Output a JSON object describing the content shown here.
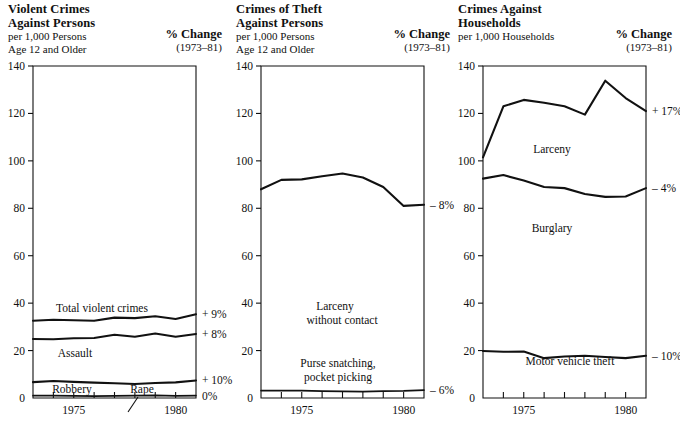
{
  "panels": [
    {
      "title_line1": "Violent Crimes",
      "title_line2": "Against Persons",
      "sub_line1": "per 1,000 Persons",
      "sub_line2": "Age 12 and Older",
      "pct_title": "% Change",
      "pct_years": "(1973–81)",
      "annotations": [
        {
          "text": "Total violent crimes"
        },
        {
          "text": "Assault"
        },
        {
          "text": "Robbery"
        },
        {
          "text": "Rape"
        }
      ],
      "pct_labels": [
        "+ 9%",
        "+ 8%",
        "+ 10%",
        "0%"
      ]
    },
    {
      "title_line1": "Crimes of Theft",
      "title_line2": "Against Persons",
      "sub_line1": "per 1,000 Persons",
      "sub_line2": "Age 12 and Older",
      "pct_title": "% Change",
      "pct_years": "(1973–81)",
      "annotations": [
        {
          "text": "Larceny"
        },
        {
          "text": "without contact"
        },
        {
          "text": "Purse snatching,"
        },
        {
          "text": "pocket picking"
        }
      ],
      "pct_labels": [
        "– 8%",
        "– 6%"
      ]
    },
    {
      "title_line1": "Crimes Against",
      "title_line2": "Households",
      "sub_line1": "per 1,000 Households",
      "sub_line2": "",
      "pct_title": "% Change",
      "pct_years": "(1973–81)",
      "annotations": [
        {
          "text": "Larceny"
        },
        {
          "text": "Burglary"
        },
        {
          "text": "Motor vehicle theft"
        }
      ],
      "pct_labels": [
        "+ 17%",
        "– 4%",
        "– 10%"
      ]
    }
  ],
  "axis": {
    "y_ticks": [
      0,
      20,
      40,
      60,
      80,
      100,
      120,
      140
    ],
    "y_min": 0,
    "y_max": 140,
    "x_min": 1973,
    "x_max": 1981,
    "x_tick_years": [
      1974,
      1975,
      1976,
      1977,
      1978,
      1979,
      1980,
      1981
    ],
    "x_labels": [
      {
        "year": 1975,
        "text": "1975"
      },
      {
        "year": 1980,
        "text": "1980"
      }
    ]
  },
  "colors": {
    "ink": "#111111",
    "background": "#ffffff"
  },
  "chart_data": [
    {
      "type": "line",
      "title": "Violent Crimes Against Persons",
      "subtitle": "per 1,000 Persons Age 12 and Older",
      "xlabel": "",
      "ylabel": "per 1,000 Persons Age 12 and Older",
      "ylim": [
        0,
        140
      ],
      "xlim": [
        1973,
        1981
      ],
      "grid": false,
      "legend": "inline-annotations",
      "x": [
        1973,
        1974,
        1975,
        1976,
        1977,
        1978,
        1979,
        1980,
        1981
      ],
      "series": [
        {
          "name": "Total violent crimes",
          "values": [
            32.6,
            33.0,
            32.8,
            32.6,
            33.9,
            33.7,
            34.5,
            33.3,
            35.3
          ],
          "pct_change": "+ 9%"
        },
        {
          "name": "Assault",
          "values": [
            24.9,
            24.8,
            25.2,
            25.3,
            26.7,
            25.8,
            27.2,
            25.8,
            27.0
          ],
          "pct_change": "+ 8%"
        },
        {
          "name": "Robbery",
          "values": [
            6.7,
            7.2,
            6.8,
            6.5,
            6.2,
            5.9,
            6.3,
            6.6,
            7.4
          ],
          "pct_change": "+ 10%"
        },
        {
          "name": "Rape",
          "values": [
            1.0,
            1.0,
            0.9,
            0.8,
            0.9,
            1.0,
            1.1,
            0.9,
            1.0
          ],
          "pct_change": "0%"
        }
      ]
    },
    {
      "type": "line",
      "title": "Crimes of Theft Against Persons",
      "subtitle": "per 1,000 Persons Age 12 and Older",
      "xlabel": "",
      "ylabel": "per 1,000 Persons Age 12 and Older",
      "ylim": [
        0,
        140
      ],
      "xlim": [
        1973,
        1981
      ],
      "grid": false,
      "legend": "inline-annotations",
      "x": [
        1973,
        1974,
        1975,
        1976,
        1977,
        1978,
        1979,
        1980,
        1981
      ],
      "series": [
        {
          "name": "Larceny without contact",
          "values": [
            88.0,
            92.0,
            92.2,
            93.5,
            94.7,
            93.0,
            89.0,
            81.0,
            81.5
          ],
          "pct_change": "– 8%"
        },
        {
          "name": "Purse snatching, pocket picking",
          "values": [
            3.1,
            3.1,
            3.1,
            2.9,
            2.8,
            2.7,
            2.9,
            3.0,
            3.3
          ],
          "pct_change": "– 6%"
        }
      ]
    },
    {
      "type": "line",
      "title": "Crimes Against Households",
      "subtitle": "per 1,000 Households",
      "xlabel": "",
      "ylabel": "per 1,000 Households",
      "ylim": [
        0,
        140
      ],
      "xlim": [
        1973,
        1981
      ],
      "grid": false,
      "legend": "inline-annotations",
      "x": [
        1973,
        1974,
        1975,
        1976,
        1977,
        1978,
        1979,
        1980,
        1981
      ],
      "series": [
        {
          "name": "Larceny",
          "values": [
            101.5,
            123.0,
            125.7,
            124.5,
            123.0,
            119.5,
            133.8,
            126.5,
            121.0
          ],
          "pct_change": "+ 17%"
        },
        {
          "name": "Burglary",
          "values": [
            92.5,
            94.0,
            91.7,
            89.0,
            88.5,
            86.0,
            84.8,
            85.0,
            88.5
          ],
          "pct_change": "– 4%"
        },
        {
          "name": "Motor vehicle theft",
          "values": [
            19.8,
            19.5,
            19.6,
            16.8,
            17.5,
            17.8,
            17.3,
            16.8,
            17.8
          ],
          "pct_change": "– 10%"
        }
      ]
    }
  ]
}
